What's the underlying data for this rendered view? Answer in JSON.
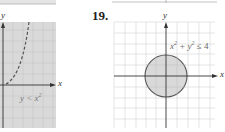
{
  "problems": [
    {
      "number": "",
      "label": "y < x^2",
      "label_main": "y < x",
      "label_exp": "2",
      "x_axis": "x",
      "y_axis": "y",
      "boundary": "dashed parabola",
      "shading": "below curve"
    },
    {
      "number": "19.",
      "label_parts": [
        "x",
        "2",
        " + y",
        "2",
        " ≤ 4"
      ],
      "x_axis": "x",
      "y_axis": "y",
      "boundary": "solid circle radius 2",
      "shading": "inside circle"
    }
  ],
  "colors": {
    "shade": "#d9d9d9",
    "grid": "#c8c8c8",
    "axis": "#333333",
    "curve": "#555555",
    "label": "#666666"
  }
}
